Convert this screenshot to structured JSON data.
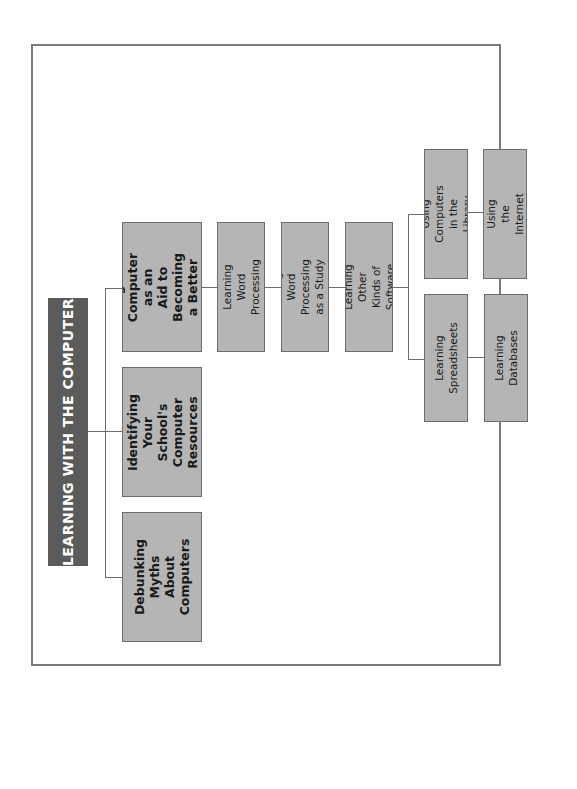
{
  "diagram": {
    "orientation": "rotated-90-ccw",
    "root": {
      "label": "LEARNING WITH THE COMPUTER"
    },
    "level1": [
      {
        "label": "Debunking\nMyths About\nComputers"
      },
      {
        "label": "Identifying\nYour School's\nComputer\nResources"
      },
      {
        "label": "Using Your\nComputer as an\nAid to Becoming\na Better Student"
      }
    ],
    "chain": [
      {
        "label": "Learning Word\nProcessing"
      },
      {
        "label": "Using Word Processing\nas a Study Aid"
      },
      {
        "label": "Learning Other\nKinds of Software"
      }
    ],
    "branches": [
      {
        "label": "Using Computers\nin the Library"
      },
      {
        "label": "Using the\nInternet"
      },
      {
        "label": "Learning\nSpreadsheets"
      },
      {
        "label": "Learning\nDatabases"
      }
    ],
    "colors": {
      "root_fill": "#5b5b5b",
      "node_fill": "#b5b5b5",
      "border": "#6d6d6d"
    }
  }
}
